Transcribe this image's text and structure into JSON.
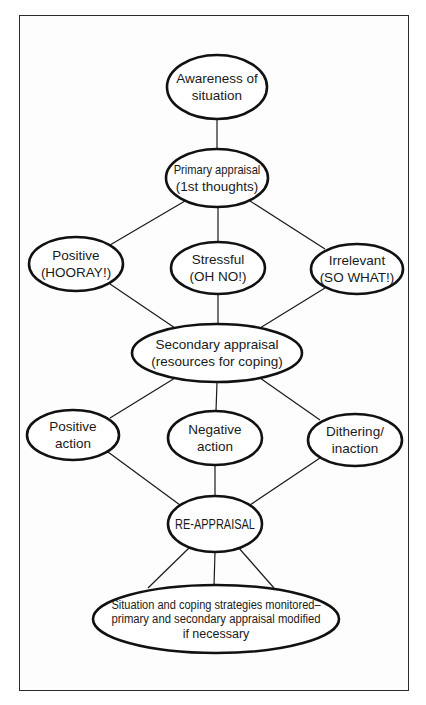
{
  "diagram": {
    "type": "flowchart",
    "frame": {
      "x": 19,
      "y": 15,
      "width": 390,
      "height": 676
    },
    "colors": {
      "stroke": "#111111",
      "text": "#1a1a1a",
      "background": "#ffffff"
    },
    "nodes": [
      {
        "id": "awareness",
        "lines": [
          "Awareness of",
          "situation"
        ],
        "cx": 217,
        "cy": 87,
        "rx": 50,
        "ry": 32
      },
      {
        "id": "primary",
        "lines": [
          "Primary appraisal",
          "(1st thoughts)"
        ],
        "cx": 217,
        "cy": 178,
        "rx": 51,
        "ry": 29
      },
      {
        "id": "positive",
        "lines": [
          "Positive",
          "(HOORAY!)"
        ],
        "cx": 76,
        "cy": 264,
        "rx": 47,
        "ry": 27
      },
      {
        "id": "stressful",
        "lines": [
          "Stressful",
          "(OH NO!)"
        ],
        "cx": 218,
        "cy": 268,
        "rx": 47,
        "ry": 26
      },
      {
        "id": "irrelevant",
        "lines": [
          "Irrelevant",
          "(SO WHAT!)"
        ],
        "cx": 357,
        "cy": 269,
        "rx": 46,
        "ry": 25
      },
      {
        "id": "secondary",
        "lines": [
          "Secondary appraisal",
          "(resources for coping)"
        ],
        "cx": 217,
        "cy": 353,
        "rx": 85,
        "ry": 29
      },
      {
        "id": "positive_action",
        "lines": [
          "Positive",
          "action"
        ],
        "cx": 73,
        "cy": 435,
        "rx": 46,
        "ry": 25
      },
      {
        "id": "negative_action",
        "lines": [
          "Negative",
          "action"
        ],
        "cx": 215,
        "cy": 438,
        "rx": 47,
        "ry": 27
      },
      {
        "id": "dithering",
        "lines": [
          "Dithering/",
          "inaction"
        ],
        "cx": 355,
        "cy": 440,
        "rx": 47,
        "ry": 26
      },
      {
        "id": "reappraisal",
        "lines": [
          "RE-APPRAISAL"
        ],
        "cx": 215,
        "cy": 524,
        "rx": 47,
        "ry": 28
      },
      {
        "id": "monitored",
        "lines": [
          "Situation and coping strategies monitored–",
          "primary and secondary appraisal modified",
          "if necessary"
        ],
        "cx": 216,
        "cy": 619,
        "rx": 123,
        "ry": 34
      }
    ],
    "edges": [
      {
        "from": "awareness",
        "to": "primary",
        "x1": 217,
        "y1": 119,
        "x2": 217,
        "y2": 149
      },
      {
        "from": "primary",
        "to": "positive",
        "x1": 185,
        "y1": 201,
        "x2": 110,
        "y2": 245
      },
      {
        "from": "primary",
        "to": "stressful",
        "x1": 218,
        "y1": 207,
        "x2": 218,
        "y2": 242
      },
      {
        "from": "primary",
        "to": "irrelevant",
        "x1": 250,
        "y1": 201,
        "x2": 325,
        "y2": 249
      },
      {
        "from": "positive",
        "to": "secondary",
        "x1": 110,
        "y1": 284,
        "x2": 175,
        "y2": 328
      },
      {
        "from": "stressful",
        "to": "secondary",
        "x1": 218,
        "y1": 294,
        "x2": 218,
        "y2": 324
      },
      {
        "from": "irrelevant",
        "to": "secondary",
        "x1": 325,
        "y1": 288,
        "x2": 260,
        "y2": 328
      },
      {
        "from": "secondary",
        "to": "positive_action",
        "x1": 175,
        "y1": 378,
        "x2": 110,
        "y2": 418
      },
      {
        "from": "secondary",
        "to": "negative_action",
        "x1": 217,
        "y1": 382,
        "x2": 216,
        "y2": 411
      },
      {
        "from": "secondary",
        "to": "dithering",
        "x1": 260,
        "y1": 378,
        "x2": 320,
        "y2": 420
      },
      {
        "from": "positive_action",
        "to": "reappraisal",
        "x1": 108,
        "y1": 452,
        "x2": 180,
        "y2": 505
      },
      {
        "from": "negative_action",
        "to": "reappraisal",
        "x1": 215,
        "y1": 465,
        "x2": 215,
        "y2": 496
      },
      {
        "from": "dithering",
        "to": "reappraisal",
        "x1": 320,
        "y1": 458,
        "x2": 250,
        "y2": 505
      },
      {
        "from": "reappraisal",
        "to": "monitored",
        "x1": 190,
        "y1": 547,
        "x2": 148,
        "y2": 588
      },
      {
        "from": "reappraisal",
        "to": "monitored",
        "x1": 215,
        "y1": 552,
        "x2": 214,
        "y2": 586
      },
      {
        "from": "reappraisal",
        "to": "monitored",
        "x1": 238,
        "y1": 547,
        "x2": 274,
        "y2": 588
      }
    ]
  }
}
